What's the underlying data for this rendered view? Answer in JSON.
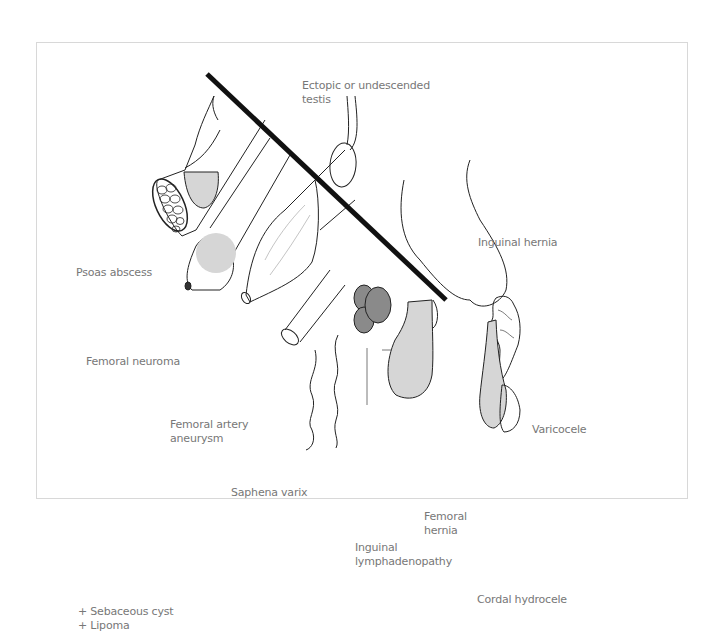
{
  "diagram": {
    "labels": {
      "ectopic_testis": "Ectopic or undescended",
      "ectopic_testis_2": "testis",
      "inguinal_hernia": "Inguinal hernia",
      "psoas_abscess": "Psoas abscess",
      "femoral_neuroma": "Femoral neuroma",
      "femoral_artery_aneurysm": "Femoral artery",
      "femoral_artery_aneurysm_2": "aneurysm",
      "saphena_varix": "Saphena varix",
      "varicocele": "Varicocele",
      "femoral_hernia": "Femoral",
      "femoral_hernia_2": "hernia",
      "inguinal_lymphadenopathy": "Inguinal",
      "inguinal_lymphadenopathy_2": "lymphadenopathy",
      "cordal_hydrocele": "Cordal hydrocele"
    },
    "notes": [
      "+ Sebaceous cyst",
      "+ Lipoma"
    ],
    "colors": {
      "light_fill": "#d6d6d6",
      "dark_fill": "#8a8a8a",
      "inguinal_ligament": "#111111",
      "outline": "#222222",
      "label_text": "#777777"
    }
  }
}
